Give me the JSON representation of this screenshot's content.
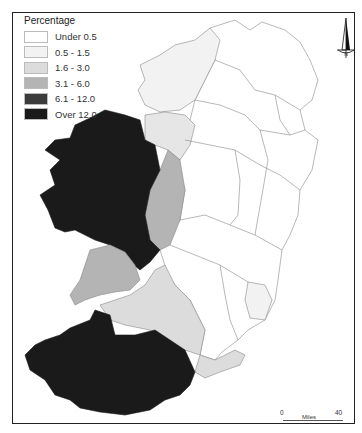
{
  "legend": {
    "title": "Percentage",
    "items": [
      {
        "label": "Under 0.5",
        "color": "#ffffff"
      },
      {
        "label": "0.5 - 1.5",
        "color": "#f2f2f2"
      },
      {
        "label": "1.6 - 3.0",
        "color": "#dcdcdc"
      },
      {
        "label": "3.1 - 6.0",
        "color": "#b4b4b4"
      },
      {
        "label": "6.1 - 12.0",
        "color": "#3c3c3c"
      },
      {
        "label": "Over 12.0",
        "color": "#1a1a1a"
      }
    ]
  },
  "compass": {
    "label": "N"
  },
  "scale": {
    "start": "0",
    "end": "40",
    "unit": "Miles"
  },
  "colors": {
    "border": "#222222",
    "boundary": "#888888"
  }
}
